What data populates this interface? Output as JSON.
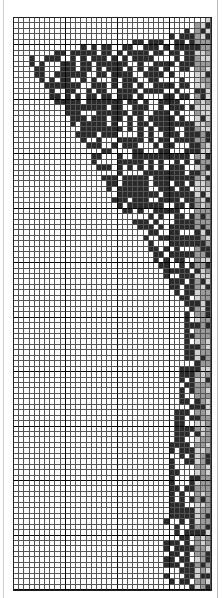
{
  "figure": {
    "type": "grid-pattern",
    "columns": 38,
    "rows": 105,
    "major_every": 10,
    "major_row_offset": 5,
    "colors": {
      "dark": "#2a2a2a",
      "gray": "#9a9a9a",
      "light": "#d2d2d2",
      "empty": "#ffffff",
      "line": "#555555",
      "major_line": "#000000"
    },
    "left_boundary_by_row": [
      [
        0,
        37
      ],
      [
        2,
        33
      ],
      [
        3,
        28
      ],
      [
        4,
        22
      ],
      [
        5,
        13
      ],
      [
        6,
        8
      ],
      [
        7,
        1
      ],
      [
        8,
        3
      ],
      [
        10,
        4
      ],
      [
        12,
        6
      ],
      [
        15,
        8
      ],
      [
        18,
        11
      ],
      [
        21,
        12
      ],
      [
        22,
        13
      ],
      [
        27,
        16
      ],
      [
        33,
        19
      ],
      [
        38,
        24
      ],
      [
        45,
        28
      ],
      [
        50,
        31
      ],
      [
        54,
        33
      ],
      [
        60,
        33
      ],
      [
        75,
        31
      ],
      [
        80,
        30
      ],
      [
        102,
        29
      ],
      [
        104,
        30
      ]
    ]
  }
}
